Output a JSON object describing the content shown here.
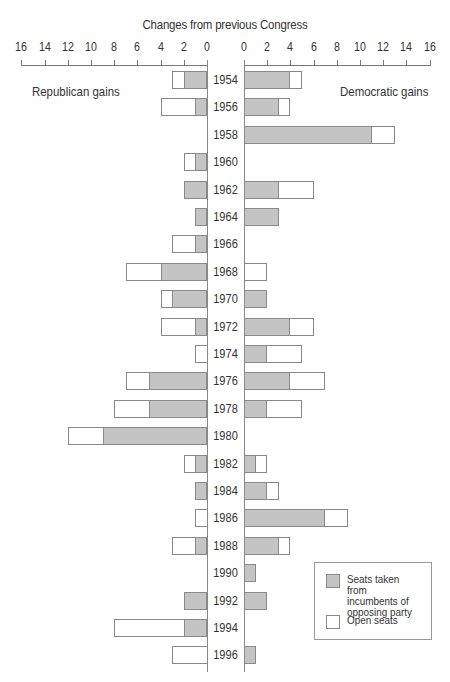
{
  "chart_data": {
    "type": "bar",
    "orientation": "horizontal-diverging",
    "title": "Changes from previous Congress",
    "left_label": "Republican gains",
    "right_label": "Democratic gains",
    "xlim": [
      0,
      16
    ],
    "ticks": [
      16,
      14,
      12,
      10,
      8,
      6,
      4,
      2,
      0
    ],
    "right_ticks": [
      0,
      2,
      4,
      6,
      8,
      10,
      12,
      14,
      16
    ],
    "categories": [
      "1954",
      "1956",
      "1958",
      "1960",
      "1962",
      "1964",
      "1966",
      "1968",
      "1970",
      "1972",
      "1974",
      "1976",
      "1978",
      "1980",
      "1982",
      "1984",
      "1986",
      "1988",
      "1990",
      "1992",
      "1994",
      "1996"
    ],
    "series": [
      {
        "name": "Republican - Seats taken from incumbents of opposing party",
        "values": [
          2,
          1,
          0,
          1,
          2,
          1,
          1,
          4,
          3,
          1,
          0,
          5,
          5,
          9,
          1,
          1,
          0,
          1,
          0,
          2,
          2,
          0
        ]
      },
      {
        "name": "Republican - Open seats",
        "values": [
          1,
          3,
          0,
          1,
          0,
          0,
          2,
          3,
          1,
          3,
          1,
          2,
          3,
          3,
          1,
          0,
          1,
          2,
          0,
          0,
          6,
          3
        ]
      },
      {
        "name": "Democratic - Seats taken from incumbents of opposing party",
        "values": [
          4,
          3,
          11,
          0,
          3,
          3,
          0,
          0,
          2,
          4,
          2,
          4,
          2,
          0,
          1,
          2,
          7,
          3,
          1,
          2,
          0,
          1
        ]
      },
      {
        "name": "Democratic - Open seats",
        "values": [
          1,
          1,
          2,
          0,
          3,
          0,
          0,
          2,
          0,
          2,
          3,
          3,
          3,
          0,
          1,
          1,
          2,
          1,
          0,
          0,
          0,
          0
        ]
      }
    ],
    "legend": [
      {
        "label": "Seats taken from incumbents of opposing party",
        "color": "#c4c4c4"
      },
      {
        "label": "Open seats",
        "color": "#ffffff"
      }
    ],
    "legend_position": "bottom-right",
    "grid": false
  },
  "colors": {
    "taken": "#c4c4c4",
    "open": "#ffffff",
    "stroke": "#888888"
  }
}
